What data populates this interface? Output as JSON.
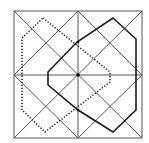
{
  "diagram": {
    "type": "geometric-figure",
    "square": {
      "x": 14,
      "y": 11,
      "size": 128
    },
    "colors": {
      "lines": "#555555",
      "polygons": "#1a1a1a",
      "background": "#ffffff"
    },
    "solid_polygon": "113,18 136,39 136,110 113,132 78,110 48,85 48,72 77,42",
    "dotted_polygon": "43,18 110,72 110,82 45,132 22,110 22,38",
    "points": [
      {
        "name": "center",
        "x": 78,
        "y": 75
      },
      {
        "name": "top-crossing",
        "x": 78,
        "y": 42
      },
      {
        "name": "bottom-crossing",
        "x": 78,
        "y": 110
      }
    ]
  }
}
